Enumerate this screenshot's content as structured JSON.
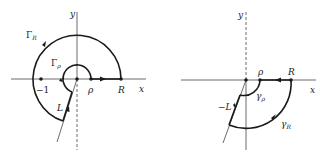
{
  "figures": [
    {
      "id": "left",
      "axes": {
        "x_label": "x",
        "y_label": "y"
      },
      "points": [
        {
          "label": "-1",
          "value": -1
        },
        {
          "label": "ρ",
          "value": "rho"
        },
        {
          "label": "R",
          "value": "R"
        },
        {
          "label": "0",
          "value": 0
        }
      ],
      "contours": [
        {
          "label": "Γ",
          "subscript": "R",
          "kind": "outer arc"
        },
        {
          "label": "Γ",
          "subscript": "ρ",
          "kind": "inner arc"
        },
        {
          "label": "L",
          "kind": "ray segment"
        }
      ],
      "labels": {
        "neg_one": "−1",
        "rho": "ρ",
        "R": "R",
        "x": "x",
        "y": "y",
        "Gamma": "Γ",
        "sub_R": "R",
        "sub_rho": "ρ",
        "L": "L"
      }
    },
    {
      "id": "right",
      "axes": {
        "x_label": "x",
        "y_label": "y"
      },
      "points": [
        {
          "label": "ρ",
          "value": "rho"
        },
        {
          "label": "R",
          "value": "R"
        },
        {
          "label": "0",
          "value": 0
        }
      ],
      "contours": [
        {
          "label": "γ",
          "subscript": "R",
          "kind": "outer arc"
        },
        {
          "label": "γ",
          "subscript": "ρ",
          "kind": "inner arc"
        },
        {
          "label": "−L",
          "kind": "ray segment"
        }
      ],
      "labels": {
        "rho": "ρ",
        "R": "R",
        "x": "x",
        "y": "y",
        "gamma": "γ",
        "sub_R": "R",
        "sub_rho": "ρ",
        "negL": "−L"
      }
    }
  ],
  "colors": {
    "ink": "#1a1a1a",
    "axis": "#444444",
    "background": "#ffffff"
  }
}
